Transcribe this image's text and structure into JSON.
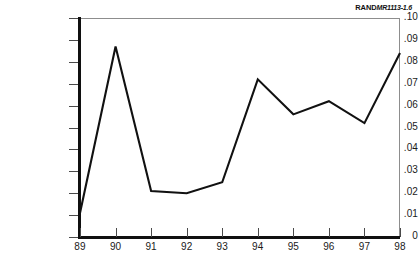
{
  "credit": {
    "publisher": "RAND",
    "document_id": "MR1113-1.6"
  },
  "chart_data": {
    "type": "line",
    "title": "",
    "subtitle": "",
    "xlabel": "",
    "ylabel": "",
    "x": [
      89,
      90,
      91,
      92,
      93,
      94,
      95,
      96,
      97,
      98
    ],
    "categories": [
      "89",
      "90",
      "91",
      "92",
      "93",
      "94",
      "95",
      "96",
      "97",
      "98"
    ],
    "values": [
      0.011,
      0.087,
      0.021,
      0.02,
      0.025,
      0.072,
      0.056,
      0.062,
      0.052,
      0.084
    ],
    "series": [
      {
        "name": "",
        "color": "#111111",
        "values": [
          0.011,
          0.087,
          0.021,
          0.02,
          0.025,
          0.072,
          0.056,
          0.062,
          0.052,
          0.084
        ]
      }
    ],
    "xlim": [
      89,
      98
    ],
    "ylim": [
      0,
      0.1
    ],
    "ytick_labels": [
      ".10",
      ".09",
      ".08",
      ".07",
      ".06",
      ".05",
      ".04",
      ".03",
      ".02",
      ".01",
      "0"
    ],
    "ytick_values": [
      0.1,
      0.09,
      0.08,
      0.07,
      0.06,
      0.05,
      0.04,
      0.03,
      0.02,
      0.01,
      0
    ],
    "xtick_labels": [
      "89",
      "90",
      "91",
      "92",
      "93",
      "94",
      "95",
      "96",
      "97",
      "98"
    ],
    "grid": false,
    "legend": false,
    "legend_position": "none"
  }
}
